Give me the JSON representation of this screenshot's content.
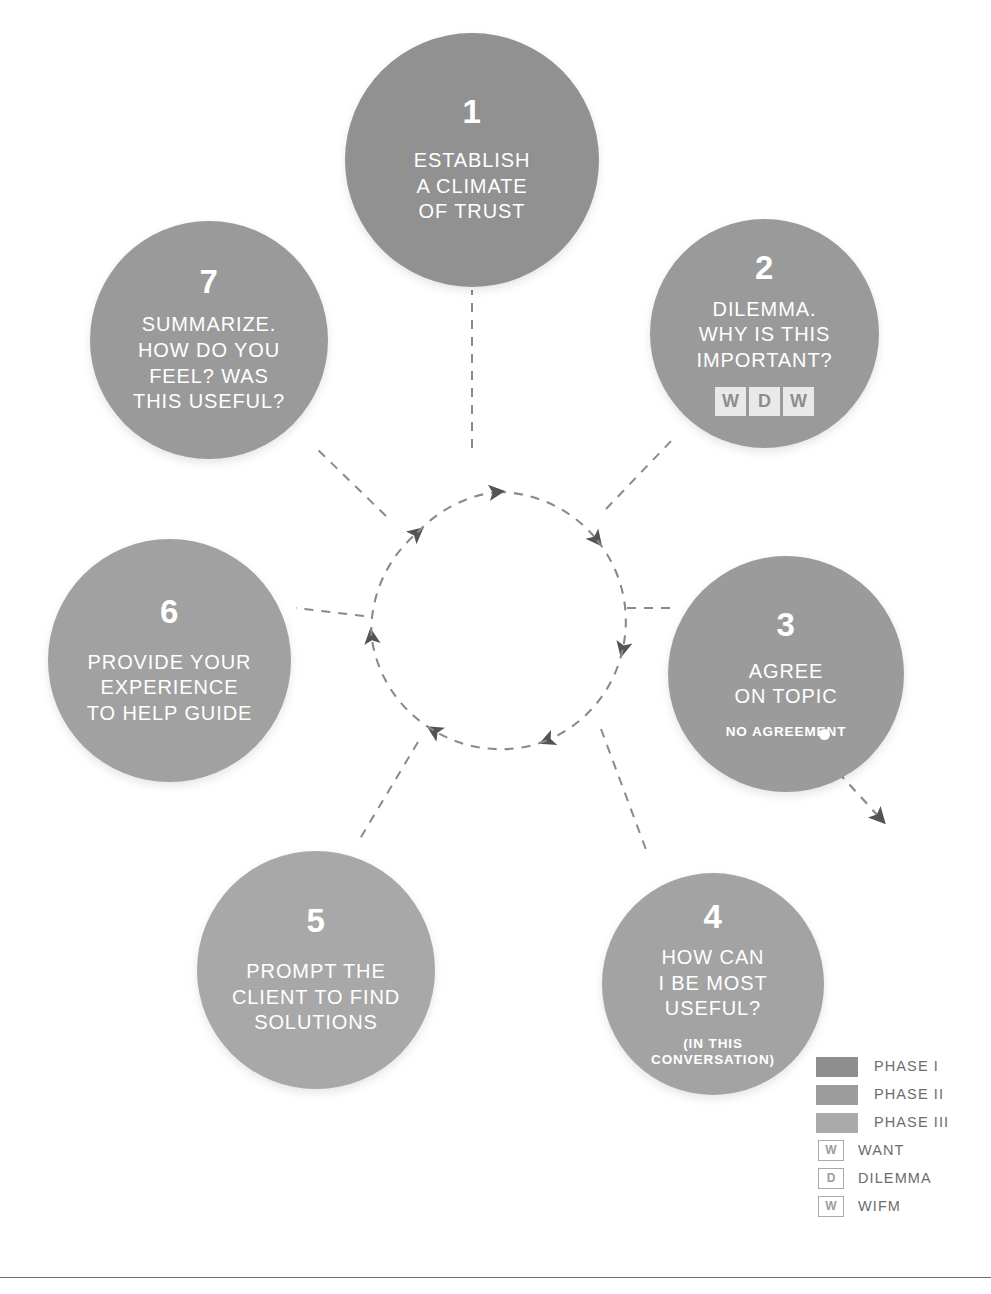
{
  "diagram": {
    "colors": {
      "phase_1": "#919191",
      "phase_2": "#9a9a9a",
      "phase_3": "#a8a8a8",
      "dashed_line": "#8a8a8a",
      "arrow": "#545454",
      "legend_text": "#6c6c6c",
      "circle_text": "#ffffff"
    },
    "steps": [
      {
        "number": "1",
        "label": "ESTABLISH\nA CLIMATE\nOF TRUST",
        "sub": "",
        "phase": "PHASE I"
      },
      {
        "number": "2",
        "label": "DILEMMA.\nWHY IS THIS\nIMPORTANT?",
        "sub": "",
        "phase": "PHASE I",
        "badges": [
          "W",
          "D",
          "W"
        ]
      },
      {
        "number": "3",
        "label": "AGREE\nON TOPIC",
        "sub": "NO AGREEMENT",
        "phase": "PHASE II"
      },
      {
        "number": "4",
        "label": "HOW CAN\nI BE MOST\nUSEFUL?",
        "sub": "(IN THIS\nCONVERSATION)",
        "phase": "PHASE II"
      },
      {
        "number": "5",
        "label": "PROMPT THE\nCLIENT TO FIND\nSOLUTIONS",
        "sub": "",
        "phase": "PHASE III"
      },
      {
        "number": "6",
        "label": "PROVIDE YOUR\nEXPERIENCE\nTO HELP GUIDE",
        "sub": "",
        "phase": "PHASE III"
      },
      {
        "number": "7",
        "label": "SUMMARIZE.\nHOW DO YOU\nFEEL? WAS\nTHIS USEFUL?",
        "sub": "",
        "phase": "PHASE I"
      }
    ]
  },
  "legend": {
    "items": [
      {
        "kind": "swatch",
        "color": "#8e8e8e",
        "label": "PHASE I"
      },
      {
        "kind": "swatch",
        "color": "#9c9c9c",
        "label": "PHASE II"
      },
      {
        "kind": "swatch",
        "color": "#aaaaaa",
        "label": "PHASE III"
      },
      {
        "kind": "box",
        "glyph": "W",
        "label": "WANT"
      },
      {
        "kind": "box",
        "glyph": "D",
        "label": "DILEMMA"
      },
      {
        "kind": "box",
        "glyph": "W",
        "label": "WIFM"
      }
    ]
  }
}
